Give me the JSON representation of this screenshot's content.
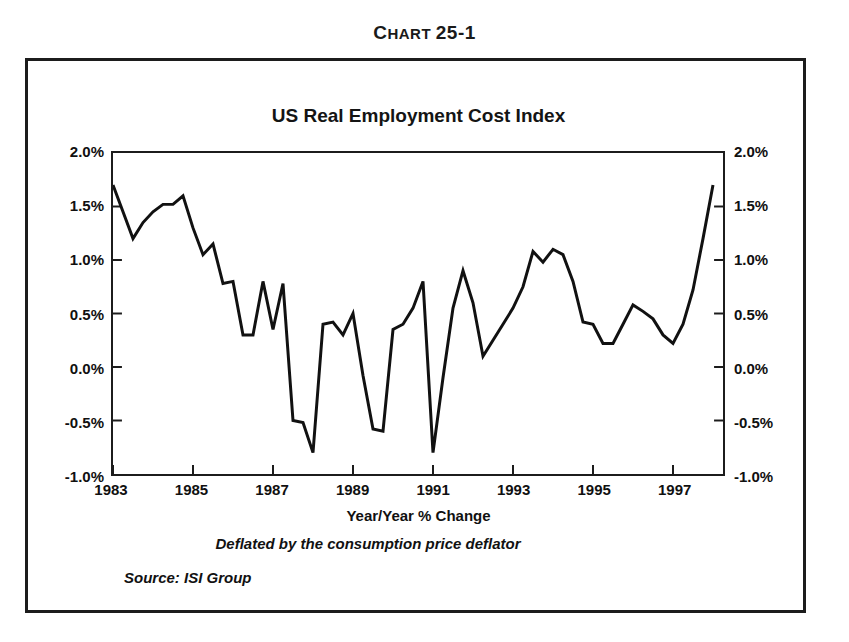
{
  "figure": {
    "caption_lead": "C",
    "caption_rest": "HART ",
    "caption_number": "25-1",
    "caption_full": "CHART 25-1"
  },
  "chart_data": {
    "type": "line",
    "title": "US Real Employment Cost Index",
    "xlabel": "Year/Year % Change",
    "ylabel": "",
    "subtitle": "Deflated by the consumption price deflator",
    "source": "Source: ISI Group",
    "grid": false,
    "legend": "none",
    "line_color": "#111111",
    "line_width": 3,
    "xlim": [
      1983.0,
      1998.25
    ],
    "ylim": [
      -1.0,
      2.0
    ],
    "xtick_labels": [
      "1983",
      "1985",
      "1987",
      "1989",
      "1991",
      "1993",
      "1995",
      "1997"
    ],
    "xtick_values": [
      1983,
      1985,
      1987,
      1989,
      1991,
      1993,
      1995,
      1997
    ],
    "ytick_labels": [
      "2.0%",
      "1.5%",
      "1.0%",
      "0.5%",
      "0.0%",
      "-0.5%",
      "-1.0%"
    ],
    "ytick_values": [
      2.0,
      1.5,
      1.0,
      0.5,
      0.0,
      -0.5,
      -1.0
    ],
    "y_axis_right_labels": [
      "2.0%",
      "1.5%",
      "1.0%",
      "0.5%",
      "0.0%",
      "-0.5%",
      "-1.0%"
    ],
    "series": [
      {
        "name": "US Real Employment Cost Index",
        "x": [
          1983.0,
          1983.25,
          1983.5,
          1983.75,
          1984.0,
          1984.25,
          1984.5,
          1984.75,
          1985.0,
          1985.25,
          1985.5,
          1985.75,
          1986.0,
          1986.25,
          1986.5,
          1986.75,
          1987.0,
          1987.25,
          1987.5,
          1987.75,
          1988.0,
          1988.25,
          1988.5,
          1988.75,
          1989.0,
          1989.25,
          1989.5,
          1989.75,
          1990.0,
          1990.25,
          1990.5,
          1990.75,
          1991.0,
          1991.25,
          1991.5,
          1991.75,
          1992.0,
          1992.25,
          1992.5,
          1992.75,
          1993.0,
          1993.25,
          1993.5,
          1993.75,
          1994.0,
          1994.25,
          1994.5,
          1994.75,
          1995.0,
          1995.25,
          1995.5,
          1995.75,
          1996.0,
          1996.25,
          1996.5,
          1996.75,
          1997.0,
          1997.25,
          1997.5,
          1997.75,
          1998.0
        ],
        "values": [
          1.7,
          1.45,
          1.2,
          1.35,
          1.45,
          1.52,
          1.52,
          1.6,
          1.3,
          1.05,
          1.15,
          0.78,
          0.8,
          0.3,
          0.3,
          0.8,
          0.35,
          0.78,
          -0.5,
          -0.52,
          -0.8,
          0.4,
          0.42,
          0.3,
          0.5,
          -0.08,
          -0.58,
          -0.6,
          0.35,
          0.4,
          0.55,
          0.8,
          -0.8,
          -0.1,
          0.55,
          0.9,
          0.6,
          0.1,
          0.25,
          0.4,
          0.55,
          0.75,
          1.08,
          0.98,
          1.1,
          1.05,
          0.8,
          0.42,
          0.4,
          0.22,
          0.22,
          0.4,
          0.58,
          0.52,
          0.45,
          0.3,
          0.22,
          0.4,
          0.72,
          1.2,
          1.7
        ]
      }
    ]
  }
}
